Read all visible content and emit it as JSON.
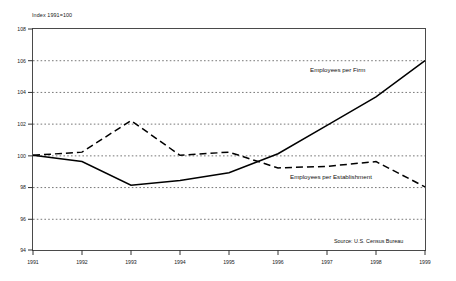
{
  "chart_data": {
    "type": "line",
    "title": "",
    "xlabel": "",
    "ylabel": "Index 1991=100",
    "x": [
      "1991",
      "1992",
      "1993",
      "1994",
      "1995",
      "1996",
      "1997",
      "1998",
      "1999"
    ],
    "categories": [
      "1991",
      "1992",
      "1993",
      "1994",
      "1995",
      "1996",
      "1997",
      "1998",
      "1999"
    ],
    "ylim": [
      94,
      108
    ],
    "xlim": [
      "1991",
      "1999"
    ],
    "yticks": [
      108,
      106,
      104,
      102,
      100,
      98,
      96,
      94
    ],
    "grid": "horizontal-dotted",
    "legend_position": "inline-annotation",
    "series": [
      {
        "name": "Employees per Firm",
        "style": "solid",
        "color": "#000000",
        "values": [
          100.0,
          99.6,
          98.1,
          98.4,
          98.9,
          100.1,
          101.9,
          103.7,
          106.0
        ]
      },
      {
        "name": "Employees per Establishment",
        "style": "dashed",
        "color": "#000000",
        "values": [
          100.0,
          100.2,
          102.2,
          100.0,
          100.2,
          99.2,
          99.3,
          99.6,
          98.0
        ]
      }
    ],
    "annotations": [
      {
        "text": "Employees per Firm",
        "x": 1997.0,
        "y": 105.2
      },
      {
        "text": "Employees per Establishment",
        "x": 1996.4,
        "y": 98.3
      }
    ],
    "source": "Source: U.S. Census Bureau"
  }
}
